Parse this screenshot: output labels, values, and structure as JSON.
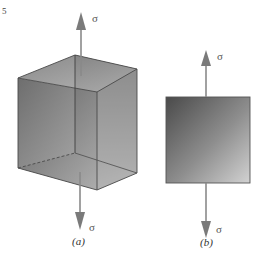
{
  "figure": {
    "corner_mark": "5",
    "panel_a": {
      "caption": "(a)",
      "top_stress_label": "σ",
      "bottom_stress_label": "σ",
      "shape": "cube"
    },
    "panel_b": {
      "caption": "(b)",
      "top_stress_label": "σ",
      "bottom_stress_label": "σ",
      "shape": "square"
    }
  },
  "colors": {
    "arrow": "#8a8a8a",
    "edge": "#555555",
    "face_dark": "#5f5f5f",
    "face_light": "#d0d0d0"
  }
}
